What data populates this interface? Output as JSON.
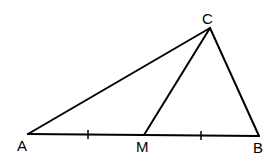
{
  "diagram": {
    "type": "geometry-triangle-with-median",
    "colors": {
      "stroke": "#000000",
      "background": "#ffffff"
    },
    "points": {
      "A": {
        "label": "A",
        "x": 28,
        "y": 134,
        "label_x": 17,
        "label_y": 151
      },
      "B": {
        "label": "B",
        "x": 259,
        "y": 136,
        "label_x": 253,
        "label_y": 153
      },
      "C": {
        "label": "C",
        "x": 210,
        "y": 28,
        "label_x": 202,
        "label_y": 24
      },
      "M": {
        "label": "M",
        "x": 144,
        "y": 135,
        "label_x": 136,
        "label_y": 152
      }
    },
    "segments": [
      {
        "name": "AC",
        "from": "A",
        "to": "C"
      },
      {
        "name": "CB",
        "from": "C",
        "to": "B"
      },
      {
        "name": "AB",
        "from": "A",
        "to": "B"
      },
      {
        "name": "CM",
        "from": "C",
        "to": "M"
      }
    ],
    "tick_marks": [
      {
        "segment": "AM",
        "x": 88,
        "y": 134.5
      },
      {
        "segment": "MB",
        "x": 201,
        "y": 135.5
      }
    ]
  }
}
